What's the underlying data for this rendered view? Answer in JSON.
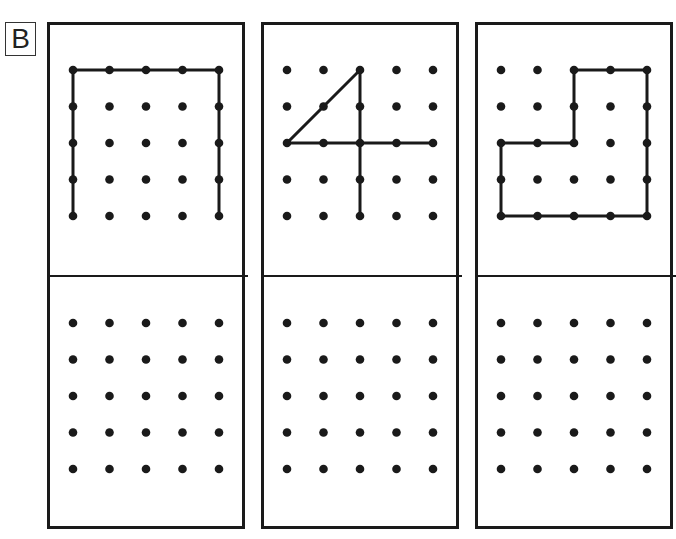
{
  "section_label": "B",
  "grid": {
    "rows": 5,
    "cols": 5,
    "spacing": 36.5
  },
  "colors": {
    "ink": "#1a1a1a",
    "background": "#ffffff"
  },
  "panels": [
    {
      "id": "panel-1",
      "name": "open-rectangle",
      "top_path": [
        [
          0,
          4
        ],
        [
          0,
          0
        ],
        [
          4,
          0
        ],
        [
          4,
          4
        ]
      ],
      "closed": false,
      "extra_segments": []
    },
    {
      "id": "panel-2",
      "name": "number-four",
      "top_path": [
        [
          2,
          4
        ],
        [
          2,
          0
        ],
        [
          0,
          2
        ],
        [
          4,
          2
        ]
      ],
      "closed": false,
      "extra_segments": []
    },
    {
      "id": "panel-3",
      "name": "l-shape",
      "top_path": [
        [
          2,
          0
        ],
        [
          4,
          0
        ],
        [
          4,
          4
        ],
        [
          0,
          4
        ],
        [
          0,
          2
        ],
        [
          2,
          2
        ]
      ],
      "closed": true,
      "extra_segments": []
    }
  ]
}
